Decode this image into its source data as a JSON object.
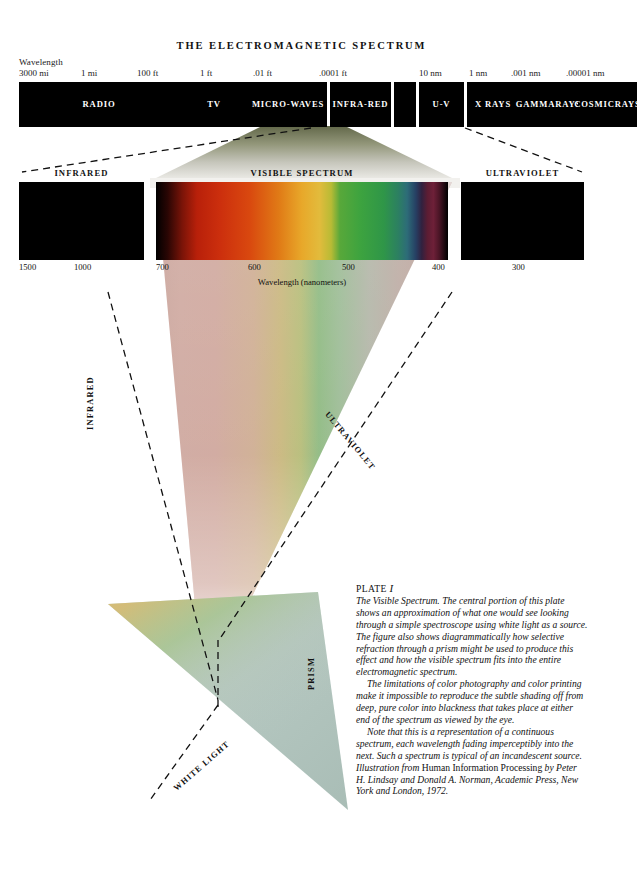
{
  "title": "THE ELECTROMAGNETIC SPECTRUM",
  "scale": {
    "caption": "Wavelength",
    "ticks": [
      {
        "label": "3000 mi",
        "x": 0
      },
      {
        "label": "1 mi",
        "x": 62
      },
      {
        "label": "100 ft",
        "x": 118
      },
      {
        "label": "1 ft",
        "x": 181
      },
      {
        "label": ".01 ft",
        "x": 234
      },
      {
        "label": ".0001 ft",
        "x": 300
      },
      {
        "label": "10 nm",
        "x": 400
      },
      {
        "label": "1 nm",
        "x": 450
      },
      {
        "label": ".001 nm",
        "x": 492
      },
      {
        "label": ".00001 nm",
        "x": 547
      }
    ]
  },
  "bands": [
    {
      "name": "RADIO",
      "label": "RADIO",
      "x": 0,
      "w": 160
    },
    {
      "name": "TV",
      "label": "TV",
      "x": 160,
      "w": 70
    },
    {
      "name": "MICROWAVES",
      "label": "MICRO-\nWAVES",
      "x": 230,
      "w": 78
    },
    {
      "name": "INFRARED",
      "label": "INFRA-\nRED",
      "x": 311,
      "w": 61
    },
    {
      "name": "GAP",
      "label": "",
      "x": 375,
      "w": 22
    },
    {
      "name": "UV",
      "label": "U-V",
      "x": 400,
      "w": 45
    },
    {
      "name": "XRAYS",
      "label": "X RAYS",
      "x": 448,
      "w": 52
    },
    {
      "name": "GAMMARAYS",
      "label": "GAMMA\nRAYS",
      "x": 500,
      "w": 59
    },
    {
      "name": "COSMICRAYS",
      "label": "COSMIC\nRAYS",
      "x": 559,
      "w": 59
    }
  ],
  "panels": {
    "infrared": {
      "label": "INFRARED",
      "ticks": [
        {
          "label": "1500",
          "x": 0
        },
        {
          "label": "1000",
          "x": 55
        }
      ]
    },
    "visible": {
      "label": "VISIBLE SPECTRUM",
      "ticks": [
        {
          "label": "700",
          "x": 0
        },
        {
          "label": "600",
          "x": 92
        },
        {
          "label": "500",
          "x": 186
        },
        {
          "label": "400",
          "x": 276
        }
      ],
      "units": "Wavelength (nanometers)"
    },
    "ultraviolet": {
      "label": "ULTRAVIOLET",
      "ticks": [
        {
          "label": "300",
          "x": 51
        }
      ]
    }
  },
  "beam_labels": {
    "infrared": "INFRARED",
    "ultraviolet": "ULTRAVIOLET",
    "prism": "PRISM",
    "white_light": "WHITE LIGHT"
  },
  "caption": {
    "plate_word": "PLATE",
    "plate_number": "I",
    "para1": "The Visible Spectrum. The central portion of this plate shows an approximation of what one would see looking through a simple spectroscope using white light as a source. The figure also shows diagrammatically how selective refraction through a prism might be used to produce this effect and how the visible spectrum fits into the entire electromagnetic spectrum.",
    "para2": "The limitations of color photography and color printing make it impossible to reproduce the subtle shading off from deep, pure color into blackness that takes place at either end of the spectrum as viewed by the eye.",
    "para3a": "Note that this is a representation of a continuous spectrum, each wavelength fading imperceptibly into the next. Such a spectrum is typical of an incandescent source. Illustration from ",
    "para3b": "Human Information Processing",
    "para3c": " by Peter H. Lindsay and Donald A. Norman, Academic Press, New York and London, 1972."
  },
  "chart_data": {
    "type": "heatmap",
    "title": "THE ELECTROMAGNETIC SPECTRUM",
    "xlabel": "Wavelength (nanometers)",
    "spectrum_stops": [
      {
        "pos": 0,
        "wavelength_nm": 720,
        "color": "#000000"
      },
      {
        "pos": 4,
        "wavelength_nm": 712,
        "color": "#2a0604"
      },
      {
        "pos": 9,
        "wavelength_nm": 702,
        "color": "#7a1408"
      },
      {
        "pos": 14,
        "wavelength_nm": 692,
        "color": "#b8200a"
      },
      {
        "pos": 22,
        "wavelength_nm": 676,
        "color": "#cc2f0d"
      },
      {
        "pos": 32,
        "wavelength_nm": 656,
        "color": "#d9480f"
      },
      {
        "pos": 42,
        "wavelength_nm": 636,
        "color": "#e07a16"
      },
      {
        "pos": 50,
        "wavelength_nm": 620,
        "color": "#e8a82a"
      },
      {
        "pos": 56,
        "wavelength_nm": 608,
        "color": "#e2bb3c"
      },
      {
        "pos": 60,
        "wavelength_nm": 600,
        "color": "#b8bb35"
      },
      {
        "pos": 63,
        "wavelength_nm": 594,
        "color": "#58a83a"
      },
      {
        "pos": 70,
        "wavelength_nm": 580,
        "color": "#3da33f"
      },
      {
        "pos": 78,
        "wavelength_nm": 564,
        "color": "#2f9648"
      },
      {
        "pos": 83,
        "wavelength_nm": 554,
        "color": "#2c7f62"
      },
      {
        "pos": 86,
        "wavelength_nm": 548,
        "color": "#2d6c78"
      },
      {
        "pos": 89,
        "wavelength_nm": 542,
        "color": "#263f63"
      },
      {
        "pos": 91,
        "wavelength_nm": 538,
        "color": "#31213f"
      },
      {
        "pos": 93,
        "wavelength_nm": 534,
        "color": "#5c1d33"
      },
      {
        "pos": 95,
        "wavelength_nm": 530,
        "color": "#6e2038"
      },
      {
        "pos": 97,
        "wavelength_nm": 526,
        "color": "#4a1526"
      },
      {
        "pos": 100,
        "wavelength_nm": 520,
        "color": "#000000"
      }
    ],
    "axis_ranges": {
      "visible_nm": [
        700,
        400
      ],
      "infrared_nm": [
        1500,
        1000
      ],
      "ultraviolet_nm": [
        300,
        300
      ]
    },
    "grid": false,
    "legend": "none"
  },
  "colors": {
    "band_fill": "#000000",
    "band_text": "#ffffff",
    "text": "#111111",
    "prism_fill": "#b9cbc4",
    "page_bg": "#ffffff"
  }
}
